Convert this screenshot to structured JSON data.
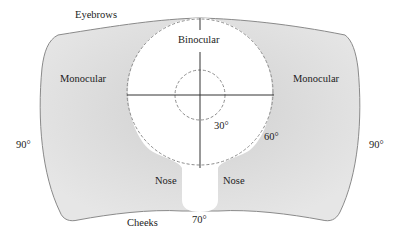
{
  "diagram": {
    "colors": {
      "monocular_fill": "#e4e4e4",
      "monocular_fill_dark": "#d2d2d2",
      "binocular_fill": "#ffffff",
      "outline": "#8a8a8a",
      "dashed": "#8c8c8c",
      "axes": "#333333",
      "text": "#222222"
    },
    "labels": {
      "eyebrows": "Eyebrows",
      "cheeks": "Cheeks",
      "monocular_left": "Monocular",
      "monocular_right": "Monocular",
      "binocular": "Binocular",
      "nose_left": "Nose",
      "nose_right": "Nose"
    },
    "angles": {
      "inner_circle": "30°",
      "outer_circle": "60°",
      "left_edge": "90°",
      "right_edge": "90°",
      "bottom": "70°"
    }
  }
}
